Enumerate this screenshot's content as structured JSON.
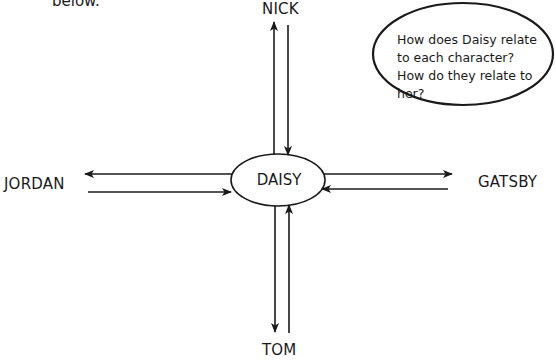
{
  "intro_text": "below.",
  "center": {
    "label": "DAISY"
  },
  "characters": {
    "top": "NICK",
    "left": "JORDAN",
    "right": "GATSBY",
    "bottom": "TOM"
  },
  "callout": {
    "text": "How does Daisy relate to each character? How do they relate to her?"
  },
  "colors": {
    "stroke": "#1a1a1a",
    "background": "#ffffff"
  }
}
